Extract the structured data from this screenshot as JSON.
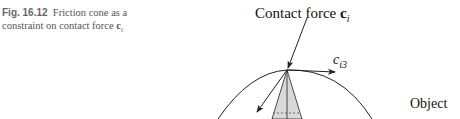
{
  "caption": {
    "fig_label": "Fig. 16.12",
    "text_before": "Friction cone as a constraint on contact force ",
    "vector_symbol": "c",
    "vector_subscript": "i"
  },
  "figure": {
    "contact_force_label": "Contact force ",
    "contact_force_vector": "c",
    "contact_force_subscript": "i",
    "axis_label": "c",
    "axis_subscript": "i3",
    "object_label": "Object",
    "colors": {
      "stroke": "#222222",
      "cone_fill": "#d9d9d9",
      "caption_text": "#555555"
    }
  }
}
